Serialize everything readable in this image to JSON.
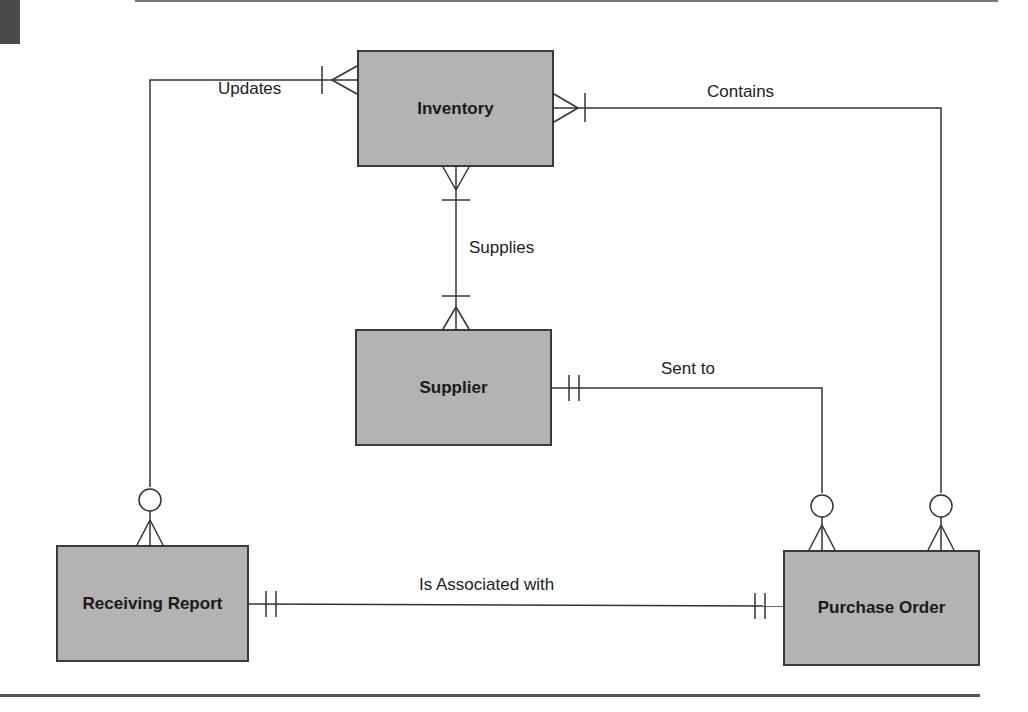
{
  "diagram": {
    "type": "entity-relationship",
    "notation": "crow's foot",
    "entities": [
      {
        "id": "inventory",
        "label": "Inventory"
      },
      {
        "id": "supplier",
        "label": "Supplier"
      },
      {
        "id": "receiving_report",
        "label": "Receiving Report"
      },
      {
        "id": "purchase_order",
        "label": "Purchase Order"
      }
    ],
    "relationships": [
      {
        "label": "Updates",
        "from": "receiving_report",
        "to": "inventory",
        "from_card": "zero-or-many",
        "to_card": "one-or-many"
      },
      {
        "label": "Contains",
        "from": "inventory",
        "to": "purchase_order",
        "from_card": "one-or-many",
        "to_card": "zero-or-many"
      },
      {
        "label": "Supplies",
        "from": "inventory",
        "to": "supplier",
        "from_card": "one-or-many",
        "to_card": "one-or-many"
      },
      {
        "label": "Sent to",
        "from": "supplier",
        "to": "purchase_order",
        "from_card": "one-and-only-one",
        "to_card": "zero-or-many"
      },
      {
        "label": "Is Associated with",
        "from": "receiving_report",
        "to": "purchase_order",
        "from_card": "one-and-only-one",
        "to_card": "one-and-only-one"
      }
    ],
    "colors": {
      "entity_fill": "#b3b3b3",
      "line": "#333333"
    }
  }
}
